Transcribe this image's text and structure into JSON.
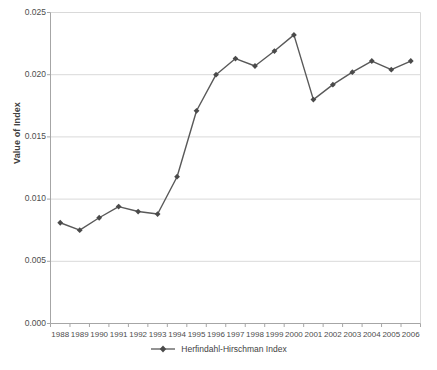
{
  "chart_data": {
    "type": "line",
    "title": "",
    "xlabel": "",
    "ylabel": "Value of Index",
    "categories": [
      "1988",
      "1989",
      "1990",
      "1991",
      "1992",
      "1993",
      "1994",
      "1995",
      "1996",
      "1997",
      "1998",
      "1999",
      "2000",
      "2001",
      "2002",
      "2003",
      "2004",
      "2005",
      "2006"
    ],
    "series": [
      {
        "name": "Herfindahl-Hirschman Index",
        "values": [
          0.0081,
          0.0075,
          0.0085,
          0.0094,
          0.009,
          0.0088,
          0.0118,
          0.0171,
          0.02,
          0.0213,
          0.0207,
          0.0219,
          0.0232,
          0.018,
          0.0192,
          0.0202,
          0.0211,
          0.0204,
          0.0211
        ]
      }
    ],
    "ylim": [
      0.0,
      0.025
    ],
    "ytick_labels": [
      "0.025",
      "0.020",
      "0.015",
      "0.010",
      "0.005",
      "0.000"
    ],
    "ytick_values": [
      0.025,
      0.02,
      0.015,
      0.01,
      0.005,
      0.0
    ],
    "grid": "horizontal",
    "legend_position": "bottom",
    "legend_entries": [
      "Herfindahl-Hirschman Index"
    ],
    "colors": {
      "series_line": "#595959",
      "marker": "#4a4a4a",
      "gridline": "#d9d9d9",
      "axis": "#a6a6a6",
      "tick_text": "#4d4d4d",
      "background": "#ffffff"
    }
  }
}
